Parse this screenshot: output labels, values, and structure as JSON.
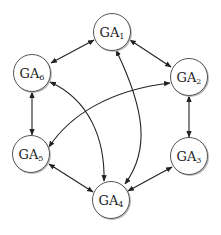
{
  "diagram": {
    "type": "directed-graph",
    "edge_style": "bidirectional-arrows",
    "colors": {
      "node_fill": "#ffffff",
      "node_stroke": "#555555",
      "edge": "#222222",
      "background": "#ffffff"
    },
    "nodes": [
      {
        "id": "GA1",
        "base": "GA",
        "sub": "1",
        "cx": 112,
        "cy": 32
      },
      {
        "id": "GA2",
        "base": "GA",
        "sub": "2",
        "cx": 189,
        "cy": 77
      },
      {
        "id": "GA3",
        "base": "GA",
        "sub": "3",
        "cx": 189,
        "cy": 156
      },
      {
        "id": "GA4",
        "base": "GA",
        "sub": "4",
        "cx": 111,
        "cy": 200
      },
      {
        "id": "GA5",
        "base": "GA",
        "sub": "5",
        "cx": 31,
        "cy": 154
      },
      {
        "id": "GA6",
        "base": "GA",
        "sub": "6",
        "cx": 32,
        "cy": 73
      }
    ],
    "edges": [
      {
        "from": "GA1",
        "to": "GA6",
        "bidirectional": true
      },
      {
        "from": "GA1",
        "to": "GA2",
        "bidirectional": true
      },
      {
        "from": "GA2",
        "to": "GA3",
        "bidirectional": true
      },
      {
        "from": "GA3",
        "to": "GA4",
        "bidirectional": true
      },
      {
        "from": "GA4",
        "to": "GA5",
        "bidirectional": true
      },
      {
        "from": "GA5",
        "to": "GA6",
        "bidirectional": true
      },
      {
        "from": "GA1",
        "to": "GA4",
        "bidirectional": true,
        "curved": true
      },
      {
        "from": "GA6",
        "to": "GA4",
        "bidirectional": true,
        "curved": true
      },
      {
        "from": "GA2",
        "to": "GA5",
        "bidirectional": true,
        "curved": true
      }
    ]
  }
}
